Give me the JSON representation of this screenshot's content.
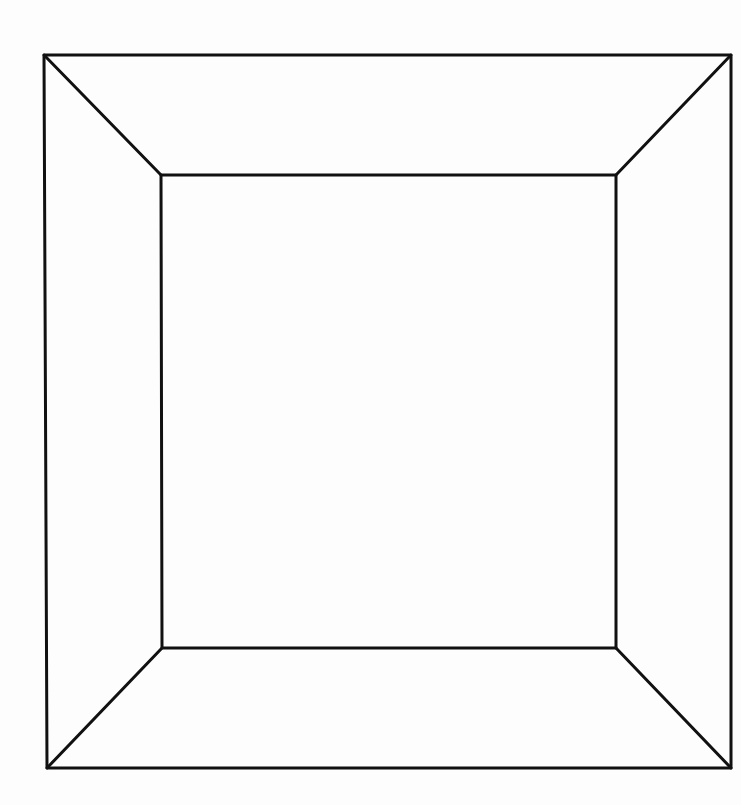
{
  "diagram": {
    "type": "frustum-line-drawing",
    "canvas": {
      "width": 741,
      "height": 805,
      "background": "#fdfdfd"
    },
    "stroke": {
      "color": "#111111",
      "width": 3
    },
    "outer_rect": {
      "top_left": [
        44,
        55
      ],
      "top_right": [
        731,
        55
      ],
      "bottom_right": [
        731,
        768
      ],
      "bottom_left": [
        47,
        768
      ]
    },
    "inner_rect": {
      "top_left": [
        161,
        175
      ],
      "top_right": [
        616,
        175
      ],
      "bottom_right": [
        616,
        648
      ],
      "bottom_left": [
        162,
        648
      ]
    },
    "connectors": [
      {
        "name": "top-left-diagonal",
        "from": "top_left",
        "to": "top_left"
      },
      {
        "name": "top-right-diagonal",
        "from": "top_right",
        "to": "top_right"
      },
      {
        "name": "bottom-right-diagonal",
        "from": "bottom_right",
        "to": "bottom_right"
      },
      {
        "name": "bottom-left-diagonal",
        "from": "bottom_left",
        "to": "bottom_left"
      }
    ]
  }
}
